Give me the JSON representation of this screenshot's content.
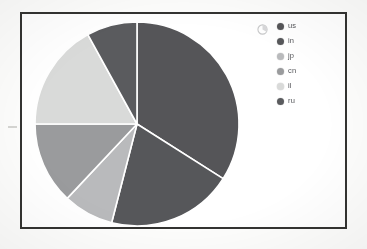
{
  "chart_data": {
    "type": "pie",
    "title": "",
    "labels": [
      "us",
      "in",
      "jp",
      "cn",
      "il",
      "ru"
    ],
    "values": [
      34,
      20,
      8,
      13,
      17,
      8
    ],
    "colors": [
      "#555558",
      "#56575a",
      "#b9babc",
      "#9a9b9d",
      "#d9dad9",
      "#5a5b5e"
    ],
    "legend_position": "right",
    "grid": false,
    "start_angle_deg": 0,
    "direction": "clockwise",
    "slice_border_color": "#ffffff"
  },
  "legend": {
    "icon": "pie-glyph-icon",
    "entries": [
      {
        "label": "us",
        "color": "#555558"
      },
      {
        "label": "in",
        "color": "#56575a"
      },
      {
        "label": "jp",
        "color": "#b9babc"
      },
      {
        "label": "cn",
        "color": "#9a9b9d"
      },
      {
        "label": "il",
        "color": "#d9dad9"
      },
      {
        "label": "ru",
        "color": "#5a5b5e"
      }
    ]
  },
  "panel": {
    "border_color": "#3a3a38",
    "background": "#ffffff"
  }
}
